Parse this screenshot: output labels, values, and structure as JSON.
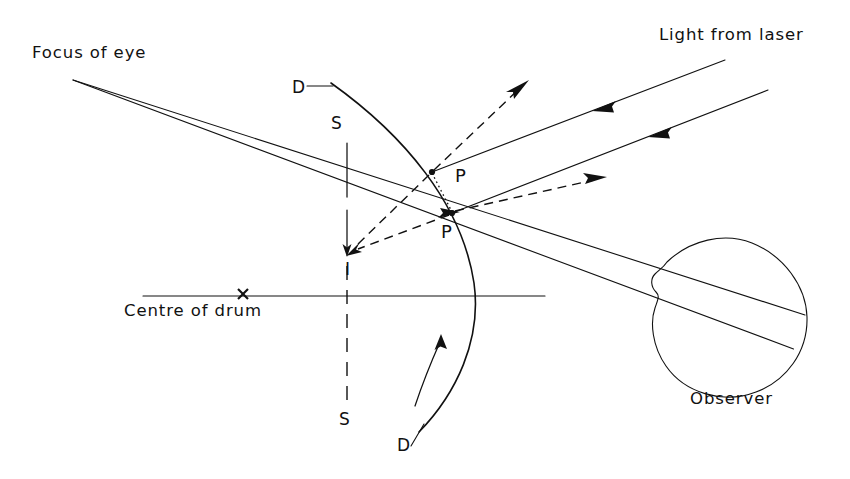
{
  "figure": {
    "domain": "diagram",
    "background_color": "#ffffff",
    "ink_color": "#111111",
    "width": 850,
    "height": 479
  },
  "labels": {
    "focus_of_eye": "Focus of eye",
    "light_from_laser": "Light from laser",
    "centre_of_drum": "Centre of drum",
    "observer": "Observer",
    "drum_top": "D",
    "drum_bottom": "D",
    "screen_top": "S",
    "screen_bottom": "S",
    "point_upper": "P",
    "point_lower": "P",
    "image_point": "I"
  },
  "label_positions": {
    "focus_of_eye": {
      "x": 32,
      "y": 58
    },
    "light_from_laser": {
      "x": 659,
      "y": 40
    },
    "centre_of_drum": {
      "x": 124,
      "y": 316
    },
    "observer": {
      "x": 690,
      "y": 404
    },
    "drum_top": {
      "x": 292,
      "y": 93
    },
    "drum_bottom": {
      "x": 397,
      "y": 451
    },
    "screen_top": {
      "x": 331,
      "y": 129
    },
    "screen_bottom": {
      "x": 339,
      "y": 425
    },
    "point_upper": {
      "x": 455,
      "y": 182
    },
    "point_lower": {
      "x": 441,
      "y": 238
    },
    "image_point": {
      "x": 345,
      "y": 275
    }
  },
  "geometry": {
    "focus_point": {
      "x": 73,
      "y": 80
    },
    "eye_convergence_point": {
      "x": 805,
      "y": 315
    },
    "point_P_upper": {
      "x": 432,
      "y": 172
    },
    "point_P_lower": {
      "x": 452,
      "y": 213
    },
    "image_point_I": {
      "x": 348,
      "y": 253
    },
    "drum_centre_mark": {
      "x": 243,
      "y": 294
    },
    "axis_line": {
      "x1": 143,
      "y1": 296,
      "x2": 545,
      "y2": 296
    },
    "screen_axis_x": 347,
    "screen_solid": {
      "y1": 143,
      "y2": 197
    },
    "screen_arrow": {
      "y1": 212,
      "y2": 255
    },
    "screen_dashed_upper": {
      "y1": 197,
      "y2": 212
    },
    "screen_dashed_lower": {
      "y1": 262,
      "y2": 408
    },
    "drum_arc": {
      "start_x": 331,
      "start_y": 83,
      "bulge_x": 474,
      "bulge_y": 282,
      "end_x": 419,
      "end_y": 432
    },
    "laser_ray_1": {
      "x1": 725,
      "y1": 60,
      "x2": 432,
      "y2": 172
    },
    "laser_ray_2": {
      "x1": 768,
      "y1": 90,
      "x2": 452,
      "y2": 213
    },
    "laser_arrow_1_at": {
      "x": 598,
      "y": 110
    },
    "laser_arrow_2_at": {
      "x": 655,
      "y": 136
    },
    "reflected_dashed_upper": {
      "x1": 432,
      "y1": 172,
      "x2": 527,
      "y2": 82
    },
    "reflected_dashed_lower": {
      "x1": 452,
      "y1": 213,
      "x2": 605,
      "y2": 177
    },
    "virtual_dashed_upper": {
      "x1": 432,
      "y1": 172,
      "x2": 348,
      "y2": 253
    },
    "virtual_dashed_lower": {
      "x1": 452,
      "y1": 213,
      "x2": 348,
      "y2": 253
    },
    "dotted_chord": {
      "x1": 432,
      "y1": 172,
      "x2": 452,
      "y2": 213
    },
    "rotation_arrow": {
      "from_x": 418,
      "from_y": 404,
      "to_x": 440,
      "to_y": 338
    },
    "eye_circle": {
      "cx": 730,
      "cy": 312,
      "r": 78
    }
  },
  "annotations": {
    "ray_count_from_focus": 2,
    "laser_beam_count": 2,
    "reflected_beam_count": 2,
    "virtual_ray_count": 2,
    "arrow_direction_laser": "incoming-down-left",
    "arrow_direction_reflected": "outgoing-up-right",
    "arrow_direction_rotation": "counterclockwise-upward"
  }
}
